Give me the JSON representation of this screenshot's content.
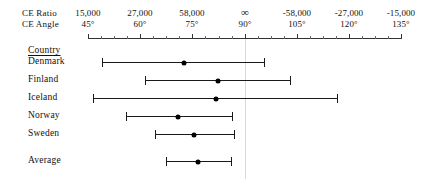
{
  "axis_headers": {
    "ratio_label": "CE Ratio",
    "angle_label": "CE Angle"
  },
  "table_header": {
    "country_label": "Country"
  },
  "chart_data": {
    "type": "forest",
    "title": "",
    "xlabel": "CE Angle",
    "ylabel": "Country",
    "grid": false,
    "legend": "none",
    "reference_line_angle": 90,
    "xlim_angle": [
      45,
      135
    ],
    "axis_ticks": [
      {
        "angle": "45°",
        "ratio": "15,000",
        "angle_value": 45,
        "x": 88
      },
      {
        "angle": "60°",
        "ratio": "27,000",
        "angle_value": 60,
        "x": 140
      },
      {
        "angle": "75°",
        "ratio": "58,000",
        "angle_value": 75,
        "x": 192
      },
      {
        "angle": "90°",
        "ratio": "∞",
        "angle_value": 90,
        "x": 245
      },
      {
        "angle": "105°",
        "ratio": "-58,000",
        "angle_value": 105,
        "x": 297
      },
      {
        "angle": "120°",
        "ratio": "-27,000",
        "angle_value": 120,
        "x": 349
      },
      {
        "angle": "135°",
        "ratio": "-15,000",
        "angle_value": 135,
        "x": 401
      }
    ],
    "minor_ticks_per_interval": 3,
    "categories": [
      "Denmark",
      "Finland",
      "Iceland",
      "Norway",
      "Sweden",
      "Average"
    ],
    "series": [
      {
        "name": "CE Angle estimate with confidence interval",
        "points": [
          {
            "category": "Denmark",
            "estimate": 72.6,
            "low": 49.1,
            "high": 95.5,
            "y": 62
          },
          {
            "category": "Finland",
            "estimate": 82.4,
            "low": 61.4,
            "high": 103.2,
            "y": 80
          },
          {
            "category": "Iceland",
            "estimate": 81.7,
            "low": 46.5,
            "high": 116.6,
            "y": 98
          },
          {
            "category": "Norway",
            "estimate": 70.9,
            "low": 56.0,
            "high": 86.4,
            "y": 116
          },
          {
            "category": "Sweden",
            "estimate": 75.4,
            "low": 64.3,
            "high": 86.9,
            "y": 134
          },
          {
            "category": "Average",
            "estimate": 76.5,
            "low": 67.4,
            "high": 86.2,
            "y": 161
          }
        ]
      }
    ]
  },
  "geometry": {
    "axis_left": 88,
    "axis_right": 401,
    "axis_y": 38,
    "label_x": 28,
    "country_heading_y": 45,
    "ratio_header_y": 8,
    "angle_header_y": 19
  }
}
